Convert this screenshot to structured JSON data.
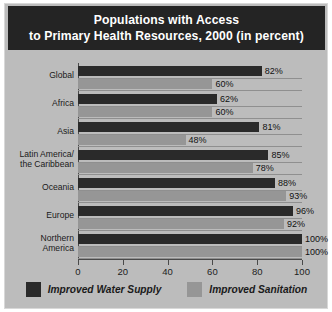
{
  "title": {
    "line1": "Populations with Access",
    "line2": "to Primary Health Resources, 2000 (in percent)"
  },
  "colors": {
    "title_background": "#242424",
    "card_background": "#bcbcbc",
    "water_supply": "#2a2a2a",
    "sanitation": "#969696",
    "axis": "#4a4a4a",
    "gridline": "#8f8f8f"
  },
  "legend": {
    "items": [
      {
        "label": "Improved Water Supply",
        "color": "#2a2a2a"
      },
      {
        "label": "Improved Sanitation",
        "color": "#969696"
      }
    ]
  },
  "axis": {
    "ticks": [
      "0",
      "20",
      "40",
      "60",
      "80",
      "100"
    ]
  },
  "chart_data": {
    "type": "bar",
    "orientation": "horizontal",
    "title": "Populations with Access to Primary Health Resources, 2000 (in percent)",
    "xlabel": "",
    "ylabel": "",
    "xlim": [
      0,
      100
    ],
    "xticks": [
      0,
      20,
      40,
      60,
      80,
      100
    ],
    "grid": true,
    "legend_position": "bottom",
    "categories": [
      "Global",
      "Africa",
      "Asia",
      "Latin America/\nthe Caribbean",
      "Oceania",
      "Europe",
      "Northern\nAmerica"
    ],
    "series": [
      {
        "name": "Improved Water Supply",
        "color": "#2a2a2a",
        "values": [
          82,
          62,
          81,
          85,
          88,
          96,
          100
        ],
        "labels": [
          "82%",
          "62%",
          "81%",
          "85%",
          "88%",
          "96%",
          "100%"
        ]
      },
      {
        "name": "Improved Sanitation",
        "color": "#969696",
        "values": [
          60,
          60,
          48,
          78,
          93,
          92,
          100
        ],
        "labels": [
          "60%",
          "60%",
          "48%",
          "78%",
          "93%",
          "92%",
          "100%"
        ]
      }
    ]
  }
}
